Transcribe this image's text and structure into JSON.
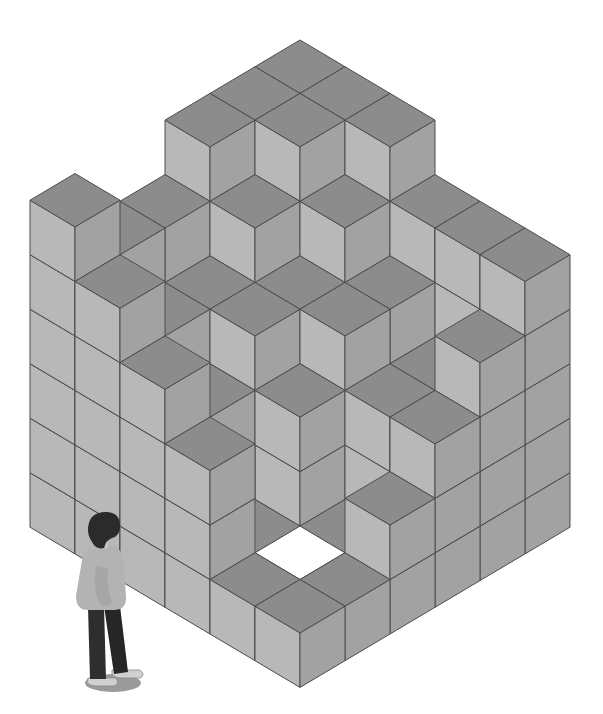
{
  "illustration": {
    "subject": "isometric stack of grey cubes with a person standing beside it",
    "grid": {
      "size": 6,
      "origin_x": 300,
      "origin_y": 367,
      "half_width": 45,
      "half_height": 26.7,
      "cube_height": 54.5,
      "heights": [
        [
          6,
          6,
          6,
          5,
          5,
          6
        ],
        [
          6,
          6,
          5,
          4,
          4,
          5
        ],
        [
          6,
          5,
          4,
          4,
          3,
          4
        ],
        [
          5,
          4,
          4,
          3,
          1,
          3
        ],
        [
          5,
          3,
          3,
          1,
          1,
          1
        ],
        [
          5,
          4,
          3,
          2,
          1,
          1
        ]
      ],
      "holes": [
        [
          4,
          4
        ]
      ]
    },
    "colors": {
      "top": "#8c8c8c",
      "left_face": "#b8b8b8",
      "right_face": "#a2a2a2",
      "stroke": "#4d4d4d",
      "hole": "#ffffff",
      "background": "#ffffff",
      "person_hair": "#2b2b2b",
      "person_sweater": "#b0b0b0",
      "person_pants": "#2e2e2e",
      "person_skin": "#c8c8c8",
      "person_shadow": "#9a9a9a",
      "person_shoes": "#d0d0d0"
    }
  }
}
